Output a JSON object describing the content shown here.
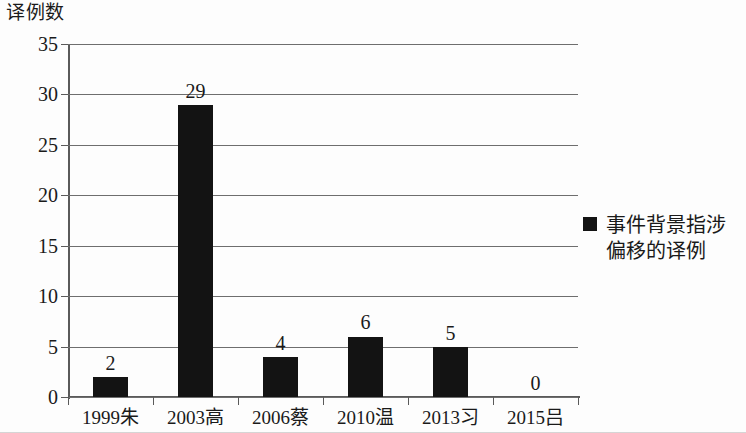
{
  "chart_data": {
    "type": "bar",
    "title": "",
    "ylabel": "译例数",
    "xlabel": "",
    "categories": [
      "1999朱",
      "2003高",
      "2006蔡",
      "2010温",
      "2013习",
      "2015吕"
    ],
    "values": [
      2,
      29,
      4,
      6,
      5,
      0
    ],
    "data_labels": [
      "2",
      "29",
      "4",
      "6",
      "5",
      "0"
    ],
    "series": [
      {
        "name": "事件背景指涉偏移的译例",
        "values": [
          2,
          29,
          4,
          6,
          5,
          0
        ],
        "color": "#131313"
      }
    ],
    "ylim": [
      0,
      35
    ],
    "ytick_values": [
      0,
      5,
      10,
      15,
      20,
      25,
      30,
      35
    ],
    "ytick_labels": [
      "0",
      "5",
      "10",
      "15",
      "20",
      "25",
      "30",
      "35"
    ],
    "grid": true,
    "grid_axis": "y",
    "legend_position": "right",
    "legend": [
      {
        "label_line1": "事件背景指涉",
        "label_line2": "偏移的译例",
        "color": "#131313"
      }
    ]
  },
  "colors": {
    "bar": "#131313",
    "axis": "#5a5a5a",
    "grid": "#6e6e6e",
    "background": "#fdfdfd",
    "text": "#1a1a1a"
  }
}
